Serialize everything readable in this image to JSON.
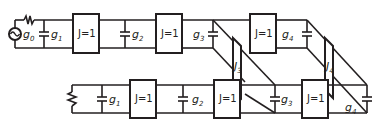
{
  "diagram": {
    "type": "circuit-schematic",
    "stroke_color": "#231f20",
    "background": "#ffffff",
    "top_filter": {
      "source_label": "g",
      "source_sub": "0",
      "caps": [
        {
          "label": "g",
          "sub": "1"
        },
        {
          "label": "g",
          "sub": "2"
        },
        {
          "label": "g",
          "sub": "3"
        },
        {
          "label": "g",
          "sub": "4"
        }
      ],
      "inverters": [
        {
          "label": "J=1"
        },
        {
          "label": "J=1"
        },
        {
          "label": "J=1"
        }
      ]
    },
    "cross_couplings": [
      {
        "label": "J",
        "sub": "3"
      },
      {
        "label": "J",
        "sub": "4"
      }
    ],
    "bottom_filter": {
      "caps": [
        {
          "label": "g",
          "sub": "1"
        },
        {
          "label": "g",
          "sub": "2"
        },
        {
          "label": "g",
          "sub": "3"
        },
        {
          "label": "g",
          "sub": "4"
        }
      ],
      "inverters": [
        {
          "label": "J=1"
        },
        {
          "label": "J=1"
        },
        {
          "label": "J=1"
        }
      ]
    }
  }
}
